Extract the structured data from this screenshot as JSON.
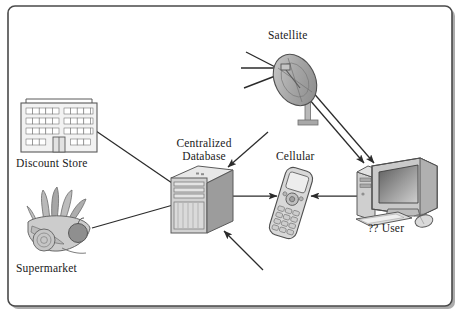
{
  "diagram": {
    "frame": {
      "border_color": "#4a4a4a",
      "background": "#ffffff",
      "shadow_color": "#9a9a9a"
    },
    "labels": {
      "satellite": "Satellite",
      "centralized_database_line1": "Centralized",
      "centralized_database_line2": "Database",
      "cellular": "Cellular",
      "discount_store": "Discount Store",
      "supermarket": "Supermarket",
      "user": "?? User"
    },
    "nodes": [
      {
        "id": "satellite",
        "name": "satellite-dish",
        "label": "Satellite",
        "x": 296,
        "y": 80
      },
      {
        "id": "database",
        "name": "centralized-database-server",
        "label": "Centralized Database",
        "x": 196,
        "y": 200
      },
      {
        "id": "cellular",
        "name": "cellular-phone",
        "label": "Cellular",
        "x": 291,
        "y": 205
      },
      {
        "id": "computer",
        "name": "desktop-computer",
        "label": "?? User",
        "x": 385,
        "y": 190
      },
      {
        "id": "discount_store",
        "name": "discount-store-building",
        "label": "Discount Store",
        "x": 60,
        "y": 128
      },
      {
        "id": "supermarket",
        "name": "supermarket-produce",
        "label": "Supermarket",
        "x": 62,
        "y": 228
      }
    ],
    "connections": [
      {
        "name": "link-discount-store-to-database",
        "from": "discount_store",
        "to": "database",
        "arrow": false
      },
      {
        "name": "link-supermarket-to-database",
        "from": "supermarket",
        "to": "database",
        "arrow": false
      },
      {
        "name": "arrow-into-database-top-right",
        "from": "upper-right",
        "to": "database",
        "arrow": true
      },
      {
        "name": "arrow-into-database-bottom",
        "from": "lower-right",
        "to": "database",
        "arrow": true
      },
      {
        "name": "arrow-database-to-cellular",
        "from": "database",
        "to": "cellular",
        "arrow": true
      },
      {
        "name": "arrow-computer-to-cellular",
        "from": "computer",
        "to": "cellular",
        "arrow": true
      },
      {
        "name": "arrow-satellite-to-computer-a",
        "from": "satellite",
        "to": "computer",
        "arrow": true
      },
      {
        "name": "arrow-satellite-to-computer-b",
        "from": "satellite",
        "to": "computer",
        "arrow": true
      },
      {
        "name": "signal-beam-upper",
        "from": "satellite-feed",
        "to": "upper-left",
        "arrow": false
      },
      {
        "name": "signal-beam-middle",
        "from": "satellite-feed",
        "to": "left",
        "arrow": false
      },
      {
        "name": "signal-beam-lower",
        "from": "satellite-feed",
        "to": "lower-left",
        "arrow": false
      }
    ],
    "colors": {
      "line": "#2b2b2b",
      "gray_light": "#dcdcdc",
      "gray_mid": "#b4b4b4",
      "gray_dark": "#8c8c8c",
      "gray_darker": "#6e6e6e",
      "outline": "#555555"
    }
  }
}
